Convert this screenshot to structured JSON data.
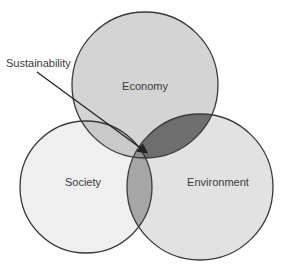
{
  "diagram": {
    "type": "venn",
    "circles": [
      {
        "name": "Economy",
        "cx": 145,
        "cy": 85,
        "r": 73,
        "fill": "#d4d4d4"
      },
      {
        "name": "Society",
        "cx": 86,
        "cy": 187,
        "r": 66,
        "fill": "#efefef"
      },
      {
        "name": "Environment",
        "cx": 200,
        "cy": 187,
        "r": 73,
        "fill": "#e2e2e2"
      }
    ],
    "intersections": {
      "economy_environment": "#6e6e6e",
      "economy_society": "#c9c9c9",
      "society_environment": "#a6a6a6",
      "all_three": "#8f8f8f"
    },
    "labels": {
      "economy": "Economy",
      "society": "Society",
      "environment": "Environment",
      "callout": "Sustainability"
    },
    "stroke": "#3a3a3a"
  }
}
